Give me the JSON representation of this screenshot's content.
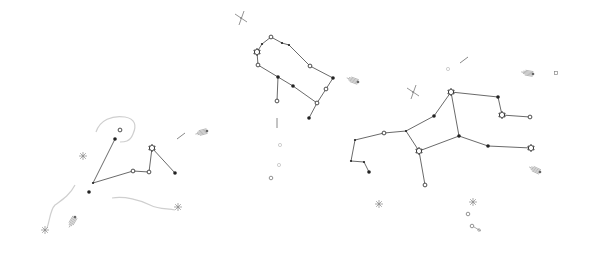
{
  "canvas": {
    "width": 592,
    "height": 255,
    "background": "#ffffff"
  },
  "colors": {
    "line": "#444444",
    "star": "#222222",
    "faint": "#cfcfcf",
    "deco": "#888888"
  },
  "constellations": [
    {
      "name": "left-constellation",
      "stars": [
        {
          "x": 120,
          "y": 130,
          "type": "open-small"
        },
        {
          "x": 115,
          "y": 139,
          "type": "dot"
        },
        {
          "x": 93,
          "y": 183,
          "type": "tiny"
        },
        {
          "x": 89,
          "y": 192,
          "type": "dot"
        },
        {
          "x": 133,
          "y": 171,
          "type": "open-small"
        },
        {
          "x": 149,
          "y": 172,
          "type": "open-small"
        },
        {
          "x": 152,
          "y": 148,
          "type": "open-star"
        },
        {
          "x": 175,
          "y": 173,
          "type": "dot"
        }
      ],
      "edges": [
        [
          1,
          2
        ],
        [
          2,
          4
        ],
        [
          4,
          5
        ],
        [
          5,
          6
        ],
        [
          6,
          7
        ]
      ]
    },
    {
      "name": "middle-constellation",
      "stars": [
        {
          "x": 271,
          "y": 37,
          "type": "open-small"
        },
        {
          "x": 262,
          "y": 44,
          "type": "tiny"
        },
        {
          "x": 257,
          "y": 52,
          "type": "open-star"
        },
        {
          "x": 258,
          "y": 65,
          "type": "open-small"
        },
        {
          "x": 282,
          "y": 43,
          "type": "tiny"
        },
        {
          "x": 289,
          "y": 45,
          "type": "tiny"
        },
        {
          "x": 310,
          "y": 66,
          "type": "open-small"
        },
        {
          "x": 333,
          "y": 78,
          "type": "dot"
        },
        {
          "x": 326,
          "y": 89,
          "type": "open-small"
        },
        {
          "x": 317,
          "y": 103,
          "type": "open-small"
        },
        {
          "x": 309,
          "y": 118,
          "type": "dot"
        },
        {
          "x": 278,
          "y": 77,
          "type": "dot"
        },
        {
          "x": 293,
          "y": 86,
          "type": "dot"
        },
        {
          "x": 277,
          "y": 101,
          "type": "open-small"
        }
      ],
      "edges": [
        [
          0,
          1
        ],
        [
          1,
          2
        ],
        [
          2,
          3
        ],
        [
          0,
          4
        ],
        [
          4,
          5
        ],
        [
          5,
          6
        ],
        [
          6,
          7
        ],
        [
          7,
          8
        ],
        [
          8,
          9
        ],
        [
          9,
          10
        ],
        [
          3,
          11
        ],
        [
          11,
          12
        ],
        [
          12,
          9
        ],
        [
          11,
          13
        ]
      ]
    },
    {
      "name": "right-constellation",
      "stars": [
        {
          "x": 451,
          "y": 92,
          "type": "open-star"
        },
        {
          "x": 498,
          "y": 97,
          "type": "dot"
        },
        {
          "x": 502,
          "y": 115,
          "type": "open-star"
        },
        {
          "x": 530,
          "y": 117,
          "type": "open-small"
        },
        {
          "x": 434,
          "y": 116,
          "type": "dot"
        },
        {
          "x": 406,
          "y": 131,
          "type": "tiny"
        },
        {
          "x": 384,
          "y": 133,
          "type": "open-small"
        },
        {
          "x": 355,
          "y": 140,
          "type": "tiny"
        },
        {
          "x": 351,
          "y": 161,
          "type": "tiny"
        },
        {
          "x": 364,
          "y": 162,
          "type": "tiny"
        },
        {
          "x": 369,
          "y": 172,
          "type": "dot"
        },
        {
          "x": 419,
          "y": 151,
          "type": "open-star"
        },
        {
          "x": 459,
          "y": 136,
          "type": "dot"
        },
        {
          "x": 488,
          "y": 146,
          "type": "dot"
        },
        {
          "x": 531,
          "y": 148,
          "type": "open-star"
        },
        {
          "x": 425,
          "y": 185,
          "type": "open-small"
        }
      ],
      "edges": [
        [
          0,
          1
        ],
        [
          1,
          2
        ],
        [
          2,
          3
        ],
        [
          0,
          4
        ],
        [
          4,
          5
        ],
        [
          5,
          6
        ],
        [
          6,
          7
        ],
        [
          7,
          8
        ],
        [
          8,
          9
        ],
        [
          9,
          10
        ],
        [
          5,
          11
        ],
        [
          11,
          12
        ],
        [
          12,
          0
        ],
        [
          12,
          13
        ],
        [
          13,
          14
        ],
        [
          11,
          15
        ]
      ]
    }
  ],
  "decorations": [
    {
      "name": "cross-star-top",
      "x": 241,
      "y": 18,
      "kind": "cross"
    },
    {
      "name": "cross-star-right",
      "x": 413,
      "y": 92,
      "kind": "cross"
    },
    {
      "name": "comet-left",
      "x": 207,
      "y": 131,
      "kind": "comet",
      "angle": -15
    },
    {
      "name": "comet-middle",
      "x": 358,
      "y": 82,
      "kind": "comet",
      "angle": 20
    },
    {
      "name": "comet-bottom-left",
      "x": 75,
      "y": 217,
      "kind": "comet",
      "angle": -60
    },
    {
      "name": "comet-right",
      "x": 540,
      "y": 172,
      "kind": "comet",
      "angle": 25
    },
    {
      "name": "comet-top-right",
      "x": 533,
      "y": 74,
      "kind": "comet",
      "angle": 10
    },
    {
      "name": "burst-bottom",
      "x": 178,
      "y": 207,
      "kind": "burst"
    },
    {
      "name": "burst-left",
      "x": 83,
      "y": 156,
      "kind": "burst"
    },
    {
      "name": "burst-far-left",
      "x": 45,
      "y": 230,
      "kind": "burst"
    },
    {
      "name": "streak-top-right",
      "x": 464,
      "y": 60,
      "kind": "streak"
    },
    {
      "name": "streak-small-left",
      "x": 181,
      "y": 136,
      "kind": "streak"
    },
    {
      "name": "dash-middle",
      "x": 277,
      "y": 123,
      "kind": "dash"
    },
    {
      "name": "small-cluster-1",
      "x": 379,
      "y": 204,
      "kind": "burst"
    },
    {
      "name": "small-cluster-2",
      "x": 473,
      "y": 202,
      "kind": "burst"
    },
    {
      "name": "circle-a",
      "x": 468,
      "y": 214,
      "kind": "ring"
    },
    {
      "name": "circle-b",
      "x": 475,
      "y": 228,
      "kind": "double-ring"
    },
    {
      "name": "circle-c",
      "x": 271,
      "y": 178,
      "kind": "ring"
    },
    {
      "name": "faint-c1",
      "x": 280,
      "y": 145,
      "kind": "faint"
    },
    {
      "name": "faint-c2",
      "x": 279,
      "y": 165,
      "kind": "faint"
    },
    {
      "name": "square-top-right",
      "x": 556,
      "y": 73,
      "kind": "square"
    },
    {
      "name": "square-right-small",
      "x": 448,
      "y": 69,
      "kind": "faint"
    }
  ],
  "faint_paths": [
    "M 96 132 C 100 120, 112 115, 125 117 C 135 119, 137 125, 133 134 C 130 142, 124 142, 120 142",
    "M 112 198 C 125 196, 140 200, 150 205 C 160 210, 168 208, 175 210",
    "M 75 185 C 70 195, 62 200, 55 205 C 50 210, 50 220, 47 228"
  ]
}
